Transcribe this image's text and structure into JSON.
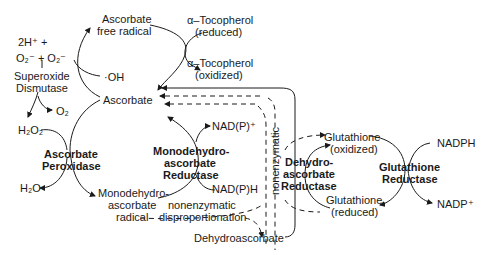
{
  "diagram": {
    "nodes": {
      "superoxide_reactants_line1": "2H⁺ +",
      "superoxide_reactants_line2": "O₂⁻ + O₂⁻",
      "superoxide_dismutase_line1": "Superoxide",
      "superoxide_dismutase_line2": "Dismutase",
      "o2": "O₂",
      "h2o2": "H₂O₂",
      "h2o": "H₂O",
      "ascorbate_peroxidase_line1": "Ascorbate",
      "ascorbate_peroxidase_line2": "Peroxidase",
      "ascorbate_free_radical_line1": "Ascorbate",
      "ascorbate_free_radical_line2": "free radical",
      "hydroxyl": "·OH",
      "ascorbate": "Ascorbate",
      "tocopherol_reduced_line1": "α–Tocopherol",
      "tocopherol_reduced_line2": "(reduced)",
      "tocopherol_oxidized_line1": "α–Tocopherol",
      "tocopherol_oxidized_line2": "(oxidized)",
      "mdhar_line1": "Monodehydro-",
      "mdhar_line2": "ascorbate",
      "mdhar_line3": "Reductase",
      "nadp_plus_1": "NAD(P)⁺",
      "nadph_1": "NAD(P)H",
      "mda_radical_line1": "Monodehydro-",
      "mda_radical_line2": "ascorbate",
      "mda_radical_line3": "radical",
      "nonenzymatic_1": "nonenzymatic",
      "disproportionation": "disproportionation",
      "nonenzymatic_vertical": "nonenzymatic",
      "dehydroascorbate": "Dehydroascorbate",
      "dhar_line1": "Dehydro-",
      "dhar_line2": "ascorbate",
      "dhar_line3": "Reductase",
      "glutathione_ox_line1": "Glutathione",
      "glutathione_ox_line2": "(oxidized)",
      "glutathione_red_line1": "Glutathione",
      "glutathione_red_line2": "(reduced)",
      "gr_line1": "Glutathione",
      "gr_line2": "Reductase",
      "nadph_2": "NADPH",
      "nadp_plus_2": "NADP⁺"
    },
    "colors": {
      "line": "#1a1a1a",
      "background": "#ffffff"
    }
  }
}
